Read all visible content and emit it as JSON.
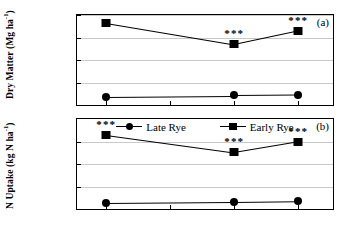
{
  "chart_data": {
    "type": "line",
    "title": "",
    "x": [
      "12/07/95",
      "01/06/96",
      "02/05/96",
      "03/06/96"
    ],
    "xlabel": "",
    "panels": [
      {
        "letter": "(a)",
        "ylabel": "Dry Matter (Mg ha",
        "ylabel_sup": "-1",
        "ylabel_close": ")",
        "ylim": [
          0,
          8
        ],
        "yticks": [
          0,
          2,
          4,
          6,
          8
        ],
        "grid": true,
        "series": [
          {
            "name": "Early Rye",
            "marker": "square",
            "x": [
              "12/07/95",
              "02/05/96",
              "03/06/96"
            ],
            "values": [
              7.3,
              5.4,
              6.6
            ],
            "significance": [
              "***",
              "***",
              "***"
            ]
          },
          {
            "name": "Late Rye",
            "marker": "circle",
            "x": [
              "12/07/95",
              "02/05/96",
              "03/06/96"
            ],
            "values": [
              0.75,
              0.85,
              0.9
            ],
            "significance": [
              "",
              "",
              ""
            ]
          }
        ]
      },
      {
        "letter": "(b)",
        "ylabel": "N Uptake (kg N ha",
        "ylabel_sup": "-1",
        "ylabel_close": ")",
        "ylim": [
          0,
          400
        ],
        "yticks": [
          0,
          100,
          200,
          300
        ],
        "grid": true,
        "series": [
          {
            "name": "Early Rye",
            "marker": "square",
            "x": [
              "12/07/95",
              "02/05/96",
              "03/06/96"
            ],
            "values": [
              330,
              252,
              300
            ],
            "significance": [
              "***",
              "***",
              "***"
            ]
          },
          {
            "name": "Late Rye",
            "marker": "circle",
            "x": [
              "12/07/95",
              "02/05/96",
              "03/06/96"
            ],
            "values": [
              28,
              32,
              35
            ],
            "significance": [
              "",
              "",
              ""
            ]
          }
        ]
      }
    ],
    "legend": {
      "position": "top-center-panel-b",
      "entries": [
        {
          "label": "Late Rye",
          "marker": "circle"
        },
        {
          "label": "Early Rye",
          "marker": "square"
        }
      ]
    }
  }
}
